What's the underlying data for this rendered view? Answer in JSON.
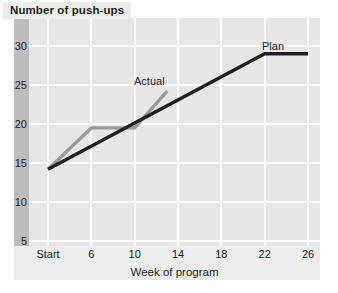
{
  "chart_data": {
    "type": "line",
    "title": "Number of push-ups",
    "xlabel": "Week of program",
    "ylabel": "Number of push-ups",
    "x_tick_labels": [
      "Start",
      "6",
      "10",
      "14",
      "18",
      "22",
      "26"
    ],
    "x_tick_values": [
      2,
      6,
      10,
      14,
      18,
      22,
      26
    ],
    "y_tick_labels": [
      "30",
      "25",
      "20",
      "15",
      "10",
      "5"
    ],
    "y_tick_values": [
      30,
      25,
      20,
      15,
      10,
      5
    ],
    "xlim": [
      2,
      26
    ],
    "ylim": [
      5,
      30
    ],
    "grid": true,
    "legend": "inline-annotations",
    "series": [
      {
        "name": "Plan",
        "color": "#1f1f1f",
        "label_text": "Plan",
        "x": [
          2,
          22,
          26
        ],
        "y": [
          14.2,
          29.0,
          29.0
        ]
      },
      {
        "name": "Actual",
        "color": "#9a9a9a",
        "label_text": "Actual",
        "x": [
          2,
          6,
          10,
          13
        ],
        "y": [
          14.2,
          19.5,
          19.5,
          24.2
        ]
      }
    ],
    "annotations": [
      {
        "text": "Actual",
        "x": 11.5,
        "y": 25.3
      },
      {
        "text": "Plan",
        "x": 21.5,
        "y": 30.0
      }
    ]
  },
  "colors": {
    "plan_line": "#1f1f1f",
    "actual_line": "#9a9a9a",
    "plot_background": "#e6e6e6",
    "gridline": "#fbfbfb",
    "panel_background": "#ededed",
    "shadow_band": "#bcbcbc",
    "page_background": "#ffffff",
    "text": "#1d1d1d"
  }
}
